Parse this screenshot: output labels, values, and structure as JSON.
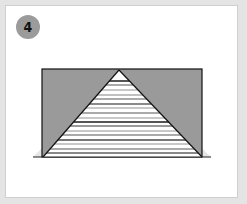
{
  "step": {
    "number": "4"
  },
  "colors": {
    "frame": "#e4e4e4",
    "card": "#ffffff",
    "badge": "#9b9b9b",
    "fold": "#999999",
    "stripe_dark": "#8a8a8a",
    "stripe_light": "#c8c8c8",
    "outline": "#111111"
  },
  "illustration": {
    "description": "folded paper diagram: gray rectangle with a striped triangle folded up in the center",
    "icon": "origami-fold-step-icon"
  }
}
